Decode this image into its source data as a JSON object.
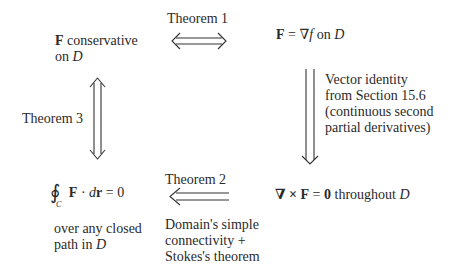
{
  "nodes": {
    "conservative": {
      "line1_bold": "F",
      "line1_rest": " conservative",
      "line2_pre": "on ",
      "line2_var": "D"
    },
    "gradient": {
      "F": "F",
      "eq": " = ∇",
      "f": "f",
      "on": " on ",
      "D": "D"
    },
    "curl": {
      "nabla": "∇ × ",
      "F": "F",
      "eq": " = ",
      "zero": "0",
      "rest": " throughout ",
      "D": "D"
    },
    "integral": {
      "oint": "∮",
      "sub": "C",
      "F": "F",
      "dot": " · ",
      "d": "d",
      "r": "r",
      "eq": " = 0",
      "desc1": "over any closed",
      "desc2_pre": "path in ",
      "desc2_var": "D"
    }
  },
  "edges": {
    "theorem1": {
      "label": "Theorem 1",
      "direction": "both"
    },
    "vector_identity": {
      "lines": [
        "Vector identity",
        "from Section 15.6",
        "(continuous second",
        "partial derivatives)"
      ],
      "direction": "down"
    },
    "theorem2": {
      "label": "Theorem 2",
      "lines": [
        "Domain's simple",
        "connectivity +",
        "Stokes's theorem"
      ],
      "direction": "left"
    },
    "theorem3": {
      "label": "Theorem 3",
      "direction": "both"
    }
  }
}
